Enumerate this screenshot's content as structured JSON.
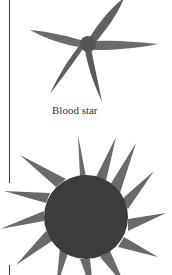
{
  "figure": {
    "items": [
      {
        "caption": "Blood star",
        "image": "blood-star-illustration"
      },
      {
        "caption": "",
        "image": "sun-star-illustration"
      }
    ]
  },
  "colors": {
    "background": "#ffffff",
    "star_body": "#5a5a5a",
    "star_body_dark": "#3c3c3c",
    "rule": "#3a3a3a",
    "caption_text": "#333333"
  }
}
